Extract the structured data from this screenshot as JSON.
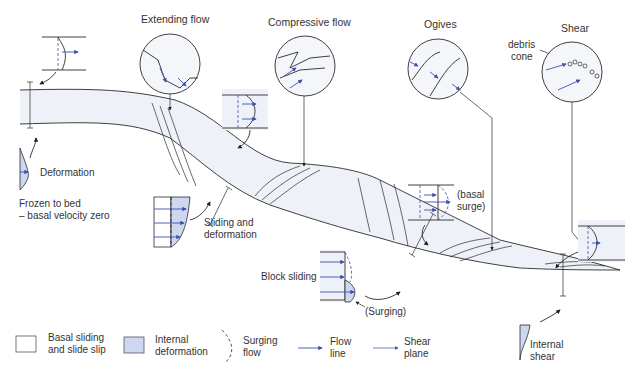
{
  "diagram": {
    "callouts": {
      "extending_flow": "Extending flow",
      "compressive_flow": "Compressive flow",
      "ogives": "Ogives",
      "shear": "Shear",
      "debris_cone_line1": "debris",
      "debris_cone_line2": "cone"
    },
    "profiles": {
      "deformation": "Deformation",
      "frozen_line1": "Frozen to bed",
      "frozen_line2": "– basal velocity zero",
      "sliding_line1": "Sliding and",
      "sliding_line2": "deformation",
      "block_sliding": "Block sliding",
      "surging": "(Surging)",
      "basal_surge_line1": "(basal",
      "basal_surge_line2": "surge)",
      "internal_shear_line1": "Internal",
      "internal_shear_line2": "shear"
    },
    "legend": [
      {
        "id": "basal",
        "line1": "Basal sliding",
        "line2": "and slide slip",
        "symbol": "white-box"
      },
      {
        "id": "internal",
        "line1": "Internal",
        "line2": "deformation",
        "symbol": "blue-box"
      },
      {
        "id": "surging",
        "line1": "Surging",
        "line2": "flow",
        "symbol": "dashed-curve"
      },
      {
        "id": "flowline",
        "line1": "Flow",
        "line2": "line",
        "symbol": "arrow"
      },
      {
        "id": "shearplane",
        "line1": "Shear",
        "line2": "plane",
        "symbol": "thin-arrow"
      }
    ],
    "colors": {
      "deformation_fill": "#cdd8f0",
      "arrow_blue": "#3c4fb0",
      "ice_shade": "#eef2f8"
    }
  }
}
